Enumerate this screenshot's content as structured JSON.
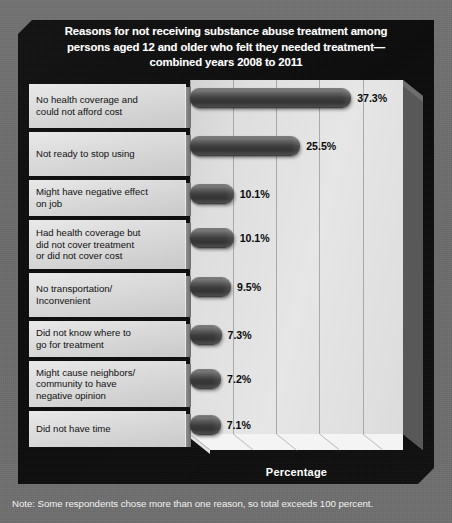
{
  "title": {
    "line1": "Reasons for not receiving substance abuse treatment among",
    "line2": "persons aged 12 and older who felt they needed treatment—",
    "line3": "combined years 2008 to 2011"
  },
  "note": "Note: Some respondents chose more than one reason, so total exceeds 100 percent.",
  "axis": {
    "x_title": "Percentage"
  },
  "colors": {
    "poster_background": "#0f0f0f",
    "outer_background": "#6e6e6e",
    "plot_face": "#e0e0e0",
    "bar_fill": "#3d3d3d",
    "label_cell": "#dcdcdc",
    "title_text": "#ffffff",
    "value_text": "#0a0a0a"
  },
  "chart_data": {
    "type": "bar",
    "orientation": "horizontal",
    "xlabel": "Percentage",
    "ylabel": "",
    "xlim": [
      0,
      45
    ],
    "xticks": [
      0,
      10,
      20,
      30,
      40
    ],
    "xticklabels": [
      "0%",
      "10%",
      "20%",
      "30%",
      "40%"
    ],
    "grid": true,
    "legend": false,
    "categories": [
      "No health coverage and could not afford cost",
      "Not ready to stop using",
      "Might have negative effect on job",
      "Had health coverage but did not cover treatment or did not cover cost",
      "No transportation/ Inconvenient",
      "Did not know where to go for treatment",
      "Might cause neighbors/ community to have negative opinion",
      "Did not have time"
    ],
    "category_lines": [
      [
        "No health coverage and",
        "could not afford cost"
      ],
      [
        "Not ready to stop using"
      ],
      [
        "Might have negative effect",
        "on job"
      ],
      [
        "Had health coverage but",
        "did not cover treatment",
        "or did not cover cost"
      ],
      [
        "No transportation/",
        "Inconvenient"
      ],
      [
        "Did not know where to",
        "go for treatment"
      ],
      [
        "Might cause neighbors/",
        "community to have",
        "negative opinion"
      ],
      [
        "Did not have time"
      ]
    ],
    "values": [
      37.3,
      25.5,
      10.1,
      10.1,
      9.5,
      7.3,
      7.2,
      7.1
    ],
    "value_labels": [
      "37.3%",
      "25.5%",
      "10.1%",
      "10.1%",
      "9.5%",
      "7.3%",
      "7.2%",
      "7.1%"
    ]
  }
}
